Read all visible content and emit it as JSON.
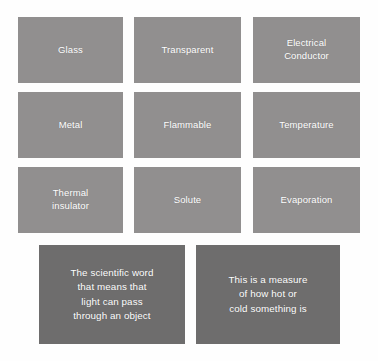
{
  "board": {
    "name": "vocabulary-matching-activity",
    "background_color": "#fefefe",
    "term_card_color": "#918f8f",
    "definition_card_color": "#6e6d6d",
    "text_color": "#ffffff"
  },
  "terms": [
    {
      "id": "glass",
      "label": "Glass"
    },
    {
      "id": "transparent",
      "label": "Transparent"
    },
    {
      "id": "electrical-conductor",
      "label": "Electrical\nConductor"
    },
    {
      "id": "metal",
      "label": "Metal"
    },
    {
      "id": "flammable",
      "label": "Flammable"
    },
    {
      "id": "temperature",
      "label": "Temperature"
    },
    {
      "id": "thermal-insulator",
      "label": "Thermal\ninsulator"
    },
    {
      "id": "solute",
      "label": "Solute"
    },
    {
      "id": "evaporation",
      "label": "Evaporation"
    }
  ],
  "definitions": [
    {
      "id": "definition-transparent",
      "text": "The scientific word\nthat means that\nlight can pass\nthrough an object"
    },
    {
      "id": "definition-temperature",
      "text": "This is a measure\nof how hot or\ncold something is"
    }
  ]
}
